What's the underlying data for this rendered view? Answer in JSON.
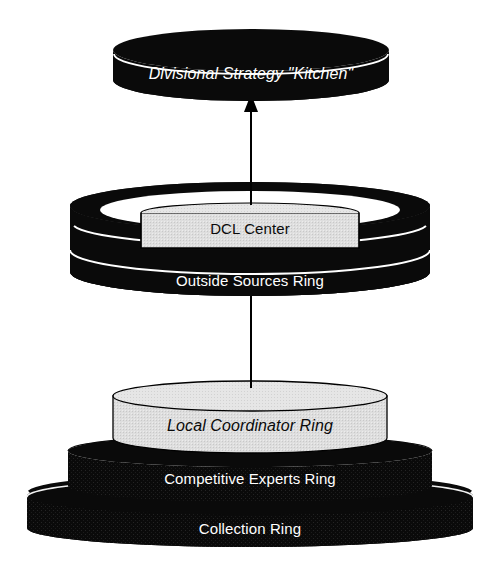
{
  "diagram": {
    "background_color": "#ffffff",
    "width": 497,
    "height": 583,
    "colors": {
      "ring_dark": "#0a0a0a",
      "ring_dark_edge": "#ffffff",
      "cylinder_light": "#dcdcdc",
      "cylinder_light_top": "#e8e8e8",
      "cylinder_outline": "#000000",
      "text_on_dark": "#ffffff",
      "text_on_light": "#0a0a0a",
      "arrow_color": "#000000"
    },
    "layers": [
      {
        "id": "divisional-strategy-kitchen",
        "label": "Divisional Strategy \"Kitchen\"",
        "style": "dark-ring",
        "text_style": "italic",
        "text_color": "#ffffff"
      },
      {
        "id": "dcl-center",
        "label": "DCL Center",
        "style": "light-cylinder",
        "text_style": "normal",
        "text_color": "#0a0a0a"
      },
      {
        "id": "outside-sources-ring",
        "label": "Outside Sources Ring",
        "style": "dark-ring",
        "text_style": "normal",
        "text_color": "#ffffff"
      },
      {
        "id": "local-coordinator-ring",
        "label": "Local Coordinator Ring",
        "style": "light-cylinder",
        "text_style": "italic",
        "text_color": "#0a0a0a"
      },
      {
        "id": "competitive-experts-ring",
        "label": "Competitive Experts Ring",
        "style": "dark-ring",
        "text_style": "normal",
        "text_color": "#ffffff"
      },
      {
        "id": "collection-ring",
        "label": "Collection Ring",
        "style": "dark-ring",
        "text_style": "normal",
        "text_color": "#ffffff"
      }
    ],
    "arrows": [
      {
        "id": "arrow-dcl-to-strategy",
        "from": "dcl-center",
        "to": "divisional-strategy-kitchen",
        "direction": "up"
      },
      {
        "id": "arrow-local-to-dcl",
        "from": "local-coordinator-ring",
        "to": "dcl-center",
        "direction": "up"
      }
    ]
  }
}
